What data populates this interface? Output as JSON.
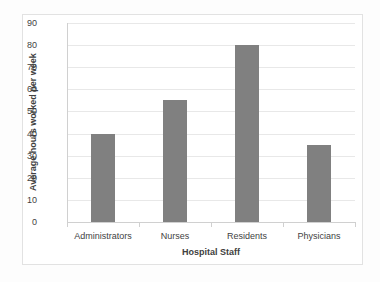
{
  "chart_data": {
    "type": "bar",
    "title": "",
    "categories": [
      "Administrators",
      "Nurses",
      "Residents",
      "Physicians"
    ],
    "values": [
      40,
      55,
      80,
      35
    ],
    "xlabel": "Hospital Staff",
    "ylabel": "Average hours worked per week",
    "ylim": [
      0,
      90
    ],
    "ytick_step": 10,
    "yticks": [
      90,
      80,
      70,
      60,
      50,
      40,
      30,
      20,
      10,
      0
    ],
    "ytick_labels": [
      "90",
      "80",
      "70",
      "60",
      "50",
      "40",
      "30",
      "20",
      "10",
      "0"
    ],
    "grid": true,
    "legend": false,
    "legend_position": "none",
    "series": [
      {
        "name": "Average hours worked per week",
        "values": [
          40,
          55,
          80,
          35
        ]
      }
    ],
    "colors": {
      "bar_fill": "#808080",
      "gridline": "#e8e8e8",
      "axis_line": "#d0d0d0",
      "frame_border": "#e2e2e2",
      "plot_background": "#ffffff",
      "page_background": "#fdfdfd",
      "tick_label_text": "#3f3f3f",
      "axis_title_text": "#404040"
    }
  }
}
